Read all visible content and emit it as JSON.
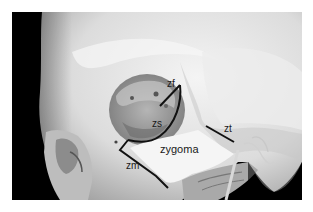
{
  "figure": {
    "labels": {
      "zf": "zf",
      "zs": "zs",
      "zt": "zt",
      "zm": "zm",
      "zygoma": "zygoma"
    },
    "colors": {
      "background": "#000000",
      "bone": "#e6e6e6",
      "orbit": "#9a9a9a",
      "suture_lines": "#111111",
      "page": "#ffffff"
    }
  }
}
